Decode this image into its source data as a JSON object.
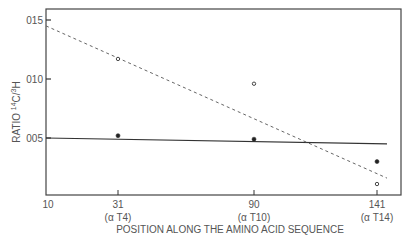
{
  "chart_data": {
    "type": "scatter",
    "title": "",
    "xlabel": "POSITION ALONG THE AMINO ACID SEQUENCE",
    "ylabel": "RATIO 14C/3H",
    "ylabel_parts": {
      "pre": "RATIO ",
      "sup1": "14",
      "mid": "C/",
      "sup2": "3",
      "post": "H"
    },
    "x_ticks": [
      {
        "value": 10,
        "label": "10",
        "sub": ""
      },
      {
        "value": 31,
        "label": "31",
        "sub": "(α T4)"
      },
      {
        "value": 90,
        "label": "90",
        "sub": "(α T10)"
      },
      {
        "value": 141,
        "label": "141",
        "sub": "(α T14)"
      }
    ],
    "y_ticks": [
      {
        "value": 0.05,
        "label": "005"
      },
      {
        "value": 0.1,
        "label": "010"
      },
      {
        "value": 0.15,
        "label": "015"
      }
    ],
    "ylim": [
      0,
      0.165
    ],
    "grid": false,
    "series": [
      {
        "name": "filled",
        "marker": "filled-circle",
        "points": [
          {
            "x": 31,
            "y": 0.052
          },
          {
            "x": 90,
            "y": 0.049
          },
          {
            "x": 141,
            "y": 0.03
          }
        ],
        "fit": {
          "style": "solid",
          "x": [
            10,
            145
          ],
          "y": [
            0.05,
            0.045
          ]
        }
      },
      {
        "name": "open",
        "marker": "open-circle",
        "points": [
          {
            "x": 31,
            "y": 0.117
          },
          {
            "x": 90,
            "y": 0.096
          },
          {
            "x": 141,
            "y": 0.011
          }
        ],
        "fit": {
          "style": "dashed",
          "x": [
            10,
            145
          ],
          "y": [
            0.145,
            0.016
          ]
        }
      }
    ]
  }
}
